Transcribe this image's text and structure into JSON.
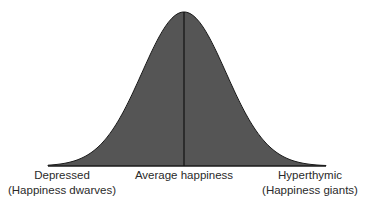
{
  "diagram": {
    "type": "normal-distribution-curve",
    "fill_color": "#555555",
    "stroke_color": "#1a1a1a",
    "center_line": true,
    "labels": {
      "left": {
        "line1": "Depressed",
        "line2": "(Happiness dwarves)"
      },
      "center": {
        "line1": "Average happiness"
      },
      "right": {
        "line1": "Hyperthymic",
        "line2": "(Happiness giants)"
      }
    }
  }
}
